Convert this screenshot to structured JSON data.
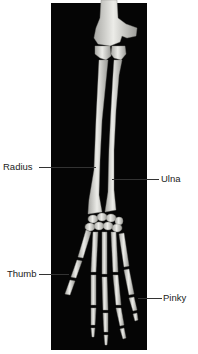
{
  "diagram": {
    "background_color": "#050505",
    "bone_color": "#d8d8d4",
    "labels": [
      {
        "id": "radius",
        "text": "Radius",
        "side": "left"
      },
      {
        "id": "ulna",
        "text": "Ulna",
        "side": "right"
      },
      {
        "id": "thumb",
        "text": "Thumb",
        "side": "left"
      },
      {
        "id": "pinky",
        "text": "Pinky",
        "side": "right"
      }
    ]
  }
}
